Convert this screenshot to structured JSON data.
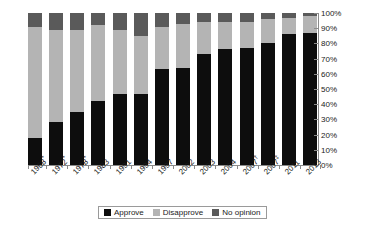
{
  "chart_data": {
    "type": "bar",
    "subtype": "stacked-bar-100-percent",
    "title": "",
    "xlabel": "",
    "ylabel": "",
    "ylim": [
      0,
      100
    ],
    "ytick_labels": [
      "0%",
      "10%",
      "20%",
      "30%",
      "40%",
      "50%",
      "60%",
      "70%",
      "80%",
      "90%",
      "100%"
    ],
    "ytick_values": [
      0,
      10,
      20,
      30,
      40,
      50,
      60,
      70,
      80,
      90,
      100
    ],
    "y_axis_position": "right",
    "grid": false,
    "legend_position": "bottom",
    "categories": [
      "1968*",
      "1972*",
      "1978*",
      "1983",
      "1991",
      "1994",
      "1997",
      "2002",
      "2003",
      "2004",
      "2007†",
      "2007‡",
      "2011",
      "2013"
    ],
    "category_labels": [
      {
        "text": "1968",
        "marker": "*"
      },
      {
        "text": "1972",
        "marker": "*"
      },
      {
        "text": "1978",
        "marker": "*"
      },
      {
        "text": "1983",
        "marker": ""
      },
      {
        "text": "1991",
        "marker": ""
      },
      {
        "text": "1994",
        "marker": ""
      },
      {
        "text": "1997",
        "marker": ""
      },
      {
        "text": "2002",
        "marker": ""
      },
      {
        "text": "2003",
        "marker": ""
      },
      {
        "text": "2004",
        "marker": ""
      },
      {
        "text": "2007",
        "marker": "†"
      },
      {
        "text": "2007",
        "marker": "‡"
      },
      {
        "text": "2011",
        "marker": ""
      },
      {
        "text": "2013",
        "marker": ""
      }
    ],
    "series": [
      {
        "name": "Approve",
        "color": "#0d0d0d",
        "values": [
          18,
          28,
          35,
          42,
          47,
          47,
          63,
          64,
          73,
          76,
          77,
          80,
          86,
          87
        ]
      },
      {
        "name": "Disapprove",
        "color": "#b4b4b4",
        "values": [
          73,
          61,
          54,
          50,
          42,
          38,
          28,
          29,
          21,
          18,
          17,
          16,
          11,
          11
        ]
      },
      {
        "name": "No opinion",
        "color": "#5a5a5a",
        "values": [
          9,
          11,
          11,
          8,
          11,
          15,
          9,
          7,
          6,
          6,
          6,
          4,
          3,
          2
        ]
      }
    ]
  },
  "legend": {
    "items": [
      {
        "label": "Approve",
        "color": "#0d0d0d"
      },
      {
        "label": "Disapprove",
        "color": "#b4b4b4"
      },
      {
        "label": "No opinion",
        "color": "#5a5a5a"
      }
    ]
  },
  "colors": {
    "approve": "#0d0d0d",
    "disapprove": "#b4b4b4",
    "no_opinion": "#5a5a5a",
    "axis": "#8a8a8a",
    "text": "#1a1a1a",
    "background": "#ffffff"
  }
}
